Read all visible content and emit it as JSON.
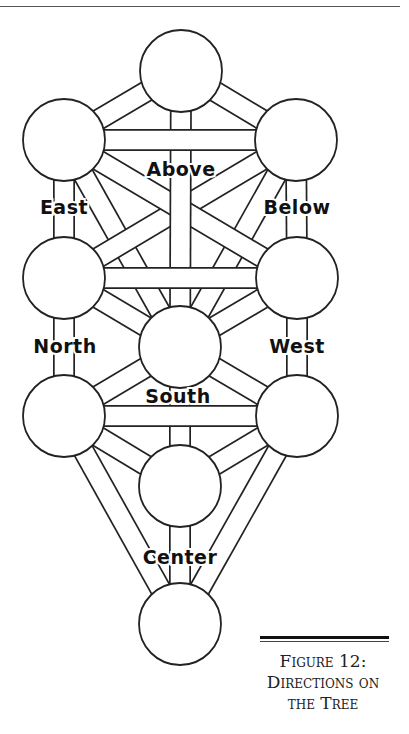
{
  "header": {
    "running_text": ""
  },
  "figure": {
    "caption_lines": [
      "Figure 12:",
      "Directions on",
      "the Tree"
    ],
    "caption_full": "Figure 12: Directions on the Tree"
  },
  "labels": {
    "above": "Above",
    "east": "East",
    "below": "Below",
    "north": "North",
    "west": "West",
    "south": "South",
    "center": "Center"
  },
  "colors": {
    "line": "#222222",
    "background": "#ffffff"
  },
  "spheres": [
    {
      "id": "top",
      "cx": 181,
      "cy": 71
    },
    {
      "id": "upper-left",
      "cx": 64,
      "cy": 140
    },
    {
      "id": "upper-right",
      "cx": 296,
      "cy": 140
    },
    {
      "id": "middle-left",
      "cx": 64,
      "cy": 278
    },
    {
      "id": "middle-right",
      "cx": 297,
      "cy": 278
    },
    {
      "id": "center",
      "cx": 180,
      "cy": 347
    },
    {
      "id": "lower-left",
      "cx": 64,
      "cy": 416
    },
    {
      "id": "lower-right",
      "cx": 297,
      "cy": 416
    },
    {
      "id": "lower-middle",
      "cx": 180,
      "cy": 486
    },
    {
      "id": "bottom",
      "cx": 180,
      "cy": 624
    }
  ]
}
